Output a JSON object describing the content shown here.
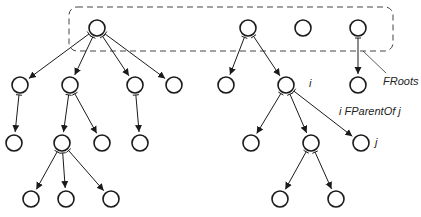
{
  "diagram": {
    "labels": {
      "froots": "FRoots",
      "i": "i",
      "j": "j",
      "parent_of": "i FParentOf j"
    },
    "colors": {
      "stroke": "#1a1a1a",
      "dash": "#444444",
      "background": "#ffffff"
    },
    "roots_box": {
      "x": 69,
      "y": 7,
      "width": 324,
      "height": 44,
      "radius": 8,
      "style": "dashed"
    },
    "node_radius": 8,
    "nodes": [
      {
        "id": "r1",
        "x": 97,
        "y": 28
      },
      {
        "id": "r2",
        "x": 248,
        "y": 28
      },
      {
        "id": "r3",
        "x": 303,
        "y": 28
      },
      {
        "id": "r4",
        "x": 358,
        "y": 28
      },
      {
        "id": "a1",
        "x": 20,
        "y": 85
      },
      {
        "id": "a2",
        "x": 70,
        "y": 85
      },
      {
        "id": "a3",
        "x": 135,
        "y": 85
      },
      {
        "id": "a4",
        "x": 174,
        "y": 85
      },
      {
        "id": "b1",
        "x": 226,
        "y": 85
      },
      {
        "id": "i",
        "x": 286,
        "y": 85
      },
      {
        "id": "d1",
        "x": 358,
        "y": 85
      },
      {
        "id": "a1c",
        "x": 14,
        "y": 143
      },
      {
        "id": "a2c1",
        "x": 62,
        "y": 143
      },
      {
        "id": "a2c2",
        "x": 102,
        "y": 143
      },
      {
        "id": "a3c",
        "x": 140,
        "y": 143
      },
      {
        "id": "ic1",
        "x": 251,
        "y": 143
      },
      {
        "id": "ic2",
        "x": 311,
        "y": 143
      },
      {
        "id": "j",
        "x": 361,
        "y": 143
      },
      {
        "id": "g1",
        "x": 31,
        "y": 199
      },
      {
        "id": "g2",
        "x": 66,
        "y": 199
      },
      {
        "id": "g3",
        "x": 111,
        "y": 199
      },
      {
        "id": "h1",
        "x": 280,
        "y": 199
      },
      {
        "id": "h2",
        "x": 336,
        "y": 199
      }
    ],
    "edges": [
      [
        "r1",
        "a1"
      ],
      [
        "r1",
        "a2"
      ],
      [
        "r1",
        "a3"
      ],
      [
        "r1",
        "a4"
      ],
      [
        "r2",
        "b1"
      ],
      [
        "r2",
        "i"
      ],
      [
        "r4",
        "d1"
      ],
      [
        "a1",
        "a1c"
      ],
      [
        "a2",
        "a2c1"
      ],
      [
        "a2",
        "a2c2"
      ],
      [
        "a3",
        "a3c"
      ],
      [
        "a2c1",
        "g1"
      ],
      [
        "a2c1",
        "g2"
      ],
      [
        "a2c1",
        "g3"
      ],
      [
        "i",
        "ic1"
      ],
      [
        "i",
        "ic2"
      ],
      [
        "i",
        "j"
      ],
      [
        "ic2",
        "h1"
      ],
      [
        "ic2",
        "h2"
      ]
    ],
    "froots_leader": {
      "x1": 363,
      "y1": 51,
      "x2": 386,
      "y2": 73
    }
  }
}
